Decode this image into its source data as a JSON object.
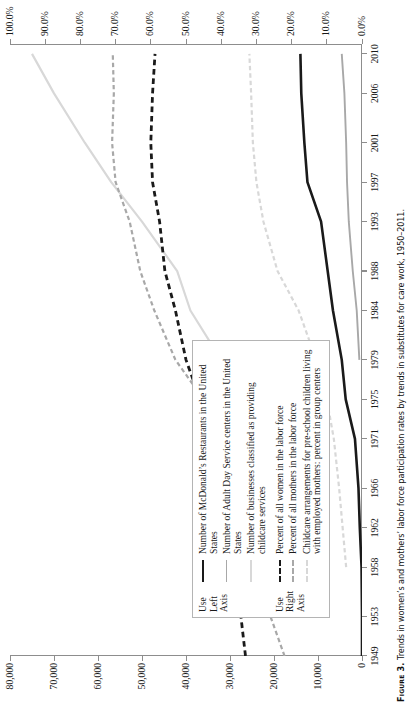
{
  "figure": {
    "label": "Figure 3.",
    "caption": "Trends in women’s and mothers’ labor force participation rates by trends in substitutes for care work, 1950–2011."
  },
  "legend": {
    "groups": [
      {
        "axis_note": "Use Left Axis",
        "axis_note_lines": [
          "Use",
          "Left",
          "Axis"
        ],
        "entries": [
          {
            "label": "Number of McDonald’s Restaurants in the United States",
            "style": "solid",
            "color": "#1a1a1a",
            "width": 2.6
          },
          {
            "label": "Number of Adult Day Service centers in the United States",
            "style": "solid",
            "color": "#a8a8a8",
            "width": 1.9
          },
          {
            "label": "Number of businesses classified as providing childcare services",
            "style": "solid",
            "color": "#d8d8d8",
            "width": 2.2
          }
        ]
      },
      {
        "axis_note": "Use Right Axis",
        "axis_note_lines": [
          "Use",
          "Right",
          "Axis"
        ],
        "entries": [
          {
            "label": "Percent of all women in the labor force",
            "style": "dashed",
            "color": "#1a1a1a",
            "width": 2.8
          },
          {
            "label": "Percent of all mothers in the labor force",
            "style": "dashed",
            "color": "#a8a8a8",
            "width": 2.2
          },
          {
            "label": "Childcare arrangements for pre-school children living with employed mothers: percent in group centers",
            "style": "dashed",
            "color": "#d8d8d8",
            "width": 2.2
          }
        ]
      }
    ]
  },
  "chart_data": {
    "type": "line",
    "title": "",
    "xlabel": "",
    "ylabel": "",
    "y2label": "",
    "grid": false,
    "legend_position": "inside-left",
    "x": [
      1949,
      1953,
      1958,
      1962,
      1966,
      1971,
      1975,
      1979,
      1984,
      1988,
      1993,
      1997,
      2001,
      2006,
      2010
    ],
    "xticklabels": [
      "1949",
      "1953",
      "1958",
      "1962",
      "1966",
      "1971",
      "1975",
      "1979",
      "1984",
      "1988",
      "1993",
      "1997",
      "2001",
      "2006",
      "2010"
    ],
    "ylim": [
      0,
      80000
    ],
    "yticks": [
      0,
      10000,
      20000,
      30000,
      40000,
      50000,
      60000,
      70000,
      80000
    ],
    "yticklabels": [
      "0",
      "10,000",
      "20,000",
      "30,000",
      "40,000",
      "50,000",
      "60,000",
      "70,000",
      "80,000"
    ],
    "y2lim": [
      0,
      100
    ],
    "y2ticks": [
      0,
      10,
      20,
      30,
      40,
      50,
      60,
      70,
      80,
      90,
      100
    ],
    "y2ticklabels": [
      "0.0%",
      "10.0%",
      "20.0%",
      "30.0%",
      "40.0%",
      "50.0%",
      "60.0%",
      "70.0%",
      "80.0%",
      "90.0%",
      "100.0%"
    ],
    "series": [
      {
        "name": "Number of McDonald’s Restaurants in the United States",
        "axis": "left",
        "style": "solid",
        "color": "#1a1a1a",
        "width": 2.6,
        "x": [
          1949,
          1953,
          1958,
          1962,
          1966,
          1971,
          1975,
          1979,
          1984,
          1988,
          1993,
          1997,
          2001,
          2006,
          2010
        ],
        "values": [
          0,
          0,
          100,
          500,
          800,
          1600,
          3700,
          4600,
          6600,
          7800,
          9300,
          12400,
          13100,
          13800,
          14000
        ]
      },
      {
        "name": "Number of Adult Day Service centers in the United States",
        "axis": "left",
        "style": "solid",
        "color": "#a8a8a8",
        "width": 1.9,
        "x": [
          1979,
          1984,
          1988,
          1993,
          1997,
          2001,
          2006,
          2010
        ],
        "values": [
          600,
          1200,
          2100,
          3000,
          3400,
          3600,
          4000,
          4600
        ]
      },
      {
        "name": "Number of businesses classified as providing childcare services",
        "axis": "left",
        "style": "solid",
        "color": "#d8d8d8",
        "width": 2.2,
        "x": [
          1971,
          1975,
          1979,
          1984,
          1988,
          1993,
          1997,
          2001,
          2006,
          2010
        ],
        "values": [
          21000,
          25000,
          32000,
          39000,
          42000,
          50000,
          57000,
          63000,
          70000,
          75000
        ]
      },
      {
        "name": "Percent of all women in the labor force",
        "axis": "right",
        "style": "dashed",
        "color": "#1a1a1a",
        "width": 2.8,
        "x": [
          1949,
          1953,
          1958,
          1962,
          1966,
          1971,
          1975,
          1979,
          1984,
          1988,
          1993,
          1997,
          2001,
          2006,
          2010
        ],
        "values": [
          33.1,
          34.4,
          36.0,
          37.2,
          39.2,
          42.0,
          46.0,
          50.0,
          53.0,
          56.0,
          57.5,
          59.5,
          60.0,
          59.5,
          58.8
        ]
      },
      {
        "name": "Percent of all mothers in the labor force",
        "axis": "right",
        "style": "dashed",
        "color": "#a8a8a8",
        "width": 2.2,
        "x": [
          1949,
          1953,
          1958,
          1962,
          1966,
          1971,
          1975,
          1979,
          1984,
          1988,
          1993,
          1997,
          2001,
          2006,
          2010
        ],
        "values": [
          22.0,
          26.0,
          30.0,
          33.0,
          36.0,
          39.5,
          45.0,
          53.0,
          59.0,
          63.0,
          66.0,
          70.0,
          71.0,
          70.5,
          70.8
        ]
      },
      {
        "name": "Childcare arrangements for pre-school children living with employed mothers: percent in group centers",
        "axis": "right",
        "style": "dashed",
        "color": "#d8d8d8",
        "width": 2.2,
        "x": [
          1958,
          1962,
          1966,
          1971,
          1975,
          1979,
          1984,
          1988,
          1993,
          1997,
          2001,
          2006,
          2010
        ],
        "values": [
          4.5,
          5.5,
          6.5,
          8.0,
          10.0,
          13.0,
          18.0,
          24.0,
          28.0,
          30.0,
          31.0,
          31.5,
          32.0
        ]
      }
    ]
  }
}
